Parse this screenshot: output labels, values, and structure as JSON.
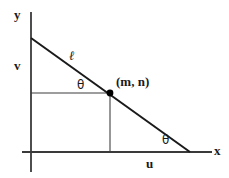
{
  "figure": {
    "kind": "geometry-diagram",
    "background_color": "#ffffff",
    "axes": {
      "x_label": "x",
      "y_label": "y",
      "axis_color": "#3a3a3a",
      "origin": {
        "x": 31,
        "y": 152
      },
      "x_axis": {
        "x1": 22,
        "y1": 152,
        "x2": 212,
        "y2": 152
      },
      "y_axis": {
        "x1": 31,
        "y1": 12,
        "x2": 31,
        "y2": 172
      },
      "x_label_pos": {
        "x": 215,
        "y": 145
      },
      "y_label_pos": {
        "x": 14,
        "y": 9
      }
    },
    "line": {
      "name": "l",
      "label": "ℓ",
      "label_pos": {
        "x": 69,
        "y": 50
      },
      "color": "#1a1a1a",
      "stroke_width": 2,
      "x1": 31,
      "y1": 38,
      "x2": 190,
      "y2": 152
    },
    "point": {
      "label": "(m, n)",
      "label_pos": {
        "x": 116,
        "y": 76
      },
      "x": 110,
      "y": 93,
      "radius": 3.4,
      "color": "#000000"
    },
    "legs": {
      "color": "#7d7d7d",
      "stroke_width": 1.6,
      "horizontal": {
        "x1": 31,
        "y1": 93,
        "x2": 110,
        "y2": 93
      },
      "vertical": {
        "x1": 110,
        "y1": 93,
        "x2": 110,
        "y2": 152
      }
    },
    "segment_labels": [
      {
        "name": "v",
        "text": "v",
        "x": 15,
        "y": 60
      },
      {
        "name": "u",
        "text": "u",
        "x": 146,
        "y": 156
      }
    ],
    "angles": [
      {
        "name": "theta-at-point",
        "text": "θ",
        "x": 77,
        "y": 79
      },
      {
        "name": "theta-at-x-axis",
        "text": "θ",
        "x": 162,
        "y": 134
      }
    ]
  }
}
